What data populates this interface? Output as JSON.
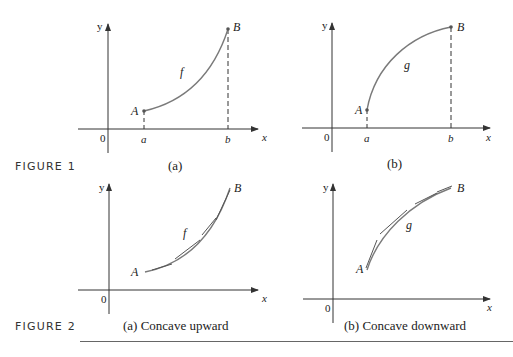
{
  "figure1": {
    "label": "FIGURE 1",
    "panels": [
      {
        "caption": "(a)",
        "function_label": "f",
        "point_start": "A",
        "point_end": "B",
        "x_start_label": "a",
        "x_end_label": "b",
        "origin_label": "0",
        "x_axis_label": "x",
        "y_axis_label": "y"
      },
      {
        "caption": "(b)",
        "function_label": "g",
        "point_start": "A",
        "point_end": "B",
        "x_start_label": "a",
        "x_end_label": "b",
        "origin_label": "0",
        "x_axis_label": "x",
        "y_axis_label": "y"
      }
    ]
  },
  "figure2": {
    "label": "FIGURE 2",
    "panels": [
      {
        "caption": "(a) Concave upward",
        "function_label": "f",
        "point_start": "A",
        "point_end": "B",
        "origin_label": "0",
        "x_axis_label": "x",
        "y_axis_label": "y"
      },
      {
        "caption": "(b) Concave downward",
        "function_label": "g",
        "point_start": "A",
        "point_end": "B",
        "origin_label": "0",
        "x_axis_label": "x",
        "y_axis_label": "y"
      }
    ]
  },
  "colors": {
    "curve": "#7a7a7a",
    "axis": "#333333",
    "text": "#222222"
  }
}
